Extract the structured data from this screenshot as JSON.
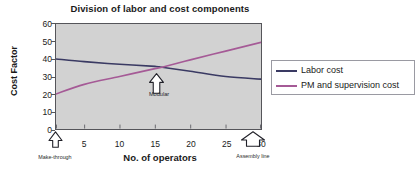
{
  "chart_data": {
    "type": "line",
    "title": "Division of labor and cost components",
    "xlabel": "No. of operators",
    "ylabel": "Cost Factor",
    "xlim": [
      1,
      30
    ],
    "ylim": [
      0,
      60
    ],
    "xticks": [
      "1",
      "5",
      "10",
      "15",
      "20",
      "25",
      "30"
    ],
    "xtick_values": [
      1,
      5,
      10,
      15,
      20,
      25,
      30
    ],
    "yticks": [
      "0",
      "10",
      "20",
      "30",
      "40",
      "50",
      "60"
    ],
    "ytick_values": [
      0,
      10,
      20,
      30,
      40,
      50,
      60
    ],
    "grid": false,
    "legend_position": "right",
    "plot_background": "#d2d2d2",
    "series": [
      {
        "name": "Labor cost",
        "color": "#3a3a63",
        "x": [
          1,
          5,
          10,
          15,
          16,
          20,
          25,
          30
        ],
        "values": [
          40,
          38.5,
          37,
          35.8,
          35.3,
          33,
          30,
          28.5
        ]
      },
      {
        "name": "PM and supervision cost",
        "color": "#a55a96",
        "x": [
          1,
          5,
          10,
          15,
          16,
          20,
          25,
          30
        ],
        "values": [
          20,
          25.5,
          30,
          34.5,
          35.3,
          39.5,
          44.5,
          49.5
        ]
      }
    ],
    "annotations": [
      {
        "label": "Make-through",
        "x": 1,
        "marker": "up-arrow"
      },
      {
        "label": "Modular",
        "x": 16,
        "marker": "up-arrow"
      },
      {
        "label": "Assembly line",
        "x": 30,
        "marker": "up-arrow"
      }
    ]
  },
  "legend": {
    "entries": [
      {
        "label": "Labor cost",
        "color": "#3a3a63"
      },
      {
        "label": "PM and supervision cost",
        "color": "#a55a96"
      }
    ]
  }
}
